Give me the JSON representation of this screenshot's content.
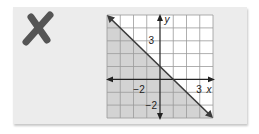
{
  "mark": {
    "icon": "x-mark-icon",
    "meaning": "incorrect",
    "color": "#555555"
  },
  "graph": {
    "x_label": "x",
    "y_label": "y",
    "ticks": {
      "x_neg": "−2",
      "x_pos": "3",
      "y_pos": "3",
      "y_neg": "−2"
    },
    "x_range": [
      -4,
      4
    ],
    "y_range": [
      -3,
      5
    ],
    "line": {
      "slope": -1,
      "intercept": 1,
      "equation": "y = -x + 1",
      "style": "solid"
    },
    "shaded_region": "below line",
    "colors": {
      "shade": "#d3d3d3",
      "grid": "#9a9a9a",
      "line": "#3a3a3a",
      "background": "#ffffff"
    }
  }
}
